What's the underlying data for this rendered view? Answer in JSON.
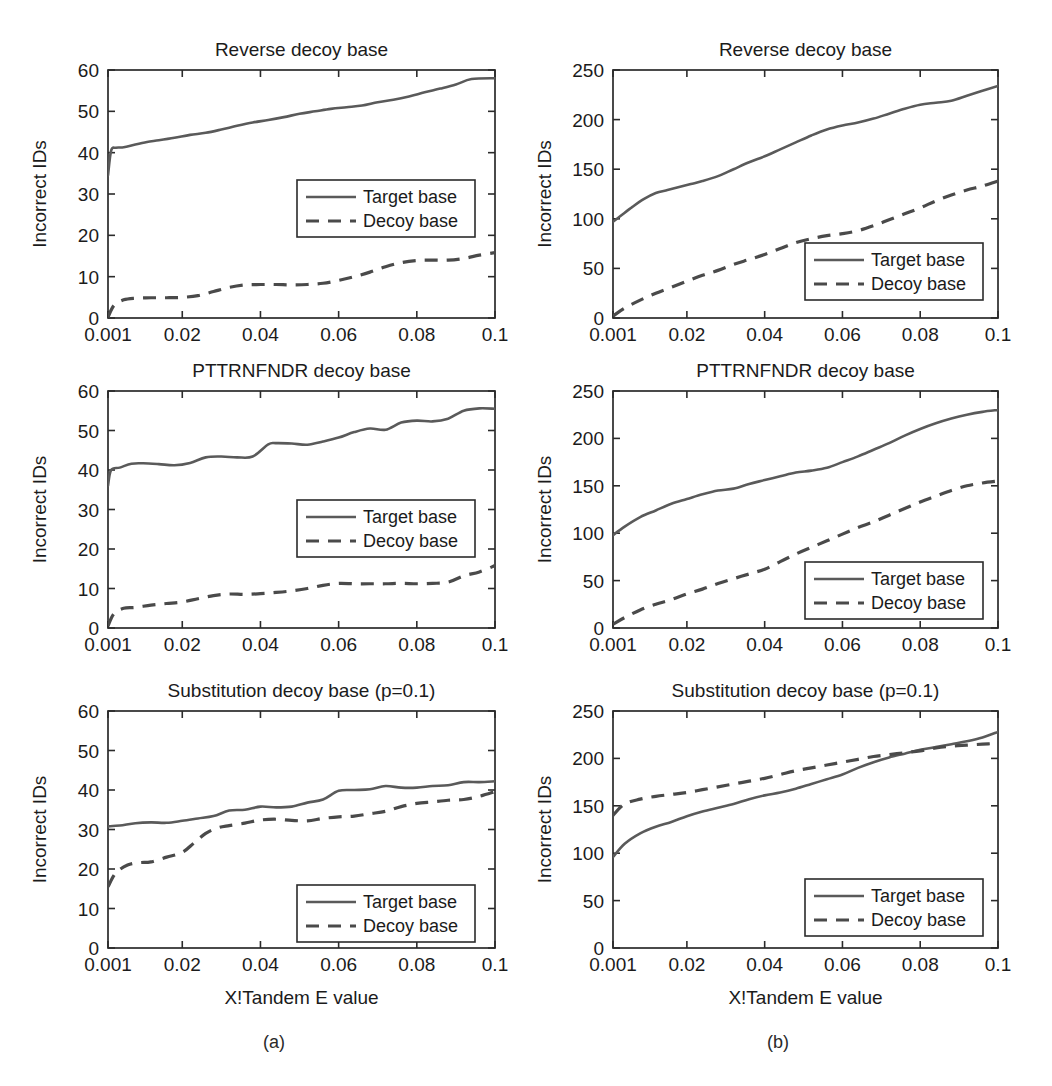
{
  "figure": {
    "subcaptions": [
      {
        "label": "(a)",
        "x": 274,
        "y": 1048
      },
      {
        "label": "(b)",
        "x": 778,
        "y": 1048
      }
    ],
    "colors": {
      "target_line": "#5a5a5a",
      "decoy_line": "#4a4a4a",
      "axis": "#2b2b2b",
      "text": "#1b1b1b",
      "background": "#ffffff"
    }
  },
  "chart_data": [
    {
      "id": "a-top",
      "type": "line",
      "title": "Reverse decoy base",
      "xlabel": "",
      "ylabel": "Incorrect IDs",
      "xticklabels": [
        "0.001",
        "0.02",
        "0.04",
        "0.06",
        "0.08",
        "0.1"
      ],
      "xtickvalues": [
        0.001,
        0.02,
        0.04,
        0.06,
        0.08,
        0.1
      ],
      "yticklabels": [
        "0",
        "10",
        "20",
        "30",
        "40",
        "50",
        "60"
      ],
      "ytickvalues": [
        0,
        10,
        20,
        30,
        40,
        50,
        60
      ],
      "xlim": [
        0.001,
        0.1
      ],
      "ylim": [
        0,
        60
      ],
      "grid": false,
      "legend_position": "center",
      "legend": [
        "Target base",
        "Decoy base"
      ],
      "series": [
        {
          "name": "Target base",
          "style": "solid",
          "x": [
            0.001,
            0.0018,
            0.003,
            0.005,
            0.008,
            0.011,
            0.014,
            0.018,
            0.022,
            0.026,
            0.03,
            0.034,
            0.038,
            0.042,
            0.046,
            0.05,
            0.054,
            0.058,
            0.062,
            0.066,
            0.07,
            0.074,
            0.078,
            0.082,
            0.086,
            0.09,
            0.094,
            0.1
          ],
          "values": [
            34.5,
            40.5,
            41.2,
            41.3,
            42.0,
            42.6,
            43.0,
            43.6,
            44.3,
            44.8,
            45.6,
            46.5,
            47.3,
            47.9,
            48.6,
            49.4,
            50.0,
            50.6,
            51.0,
            51.4,
            52.2,
            52.8,
            53.6,
            54.6,
            55.5,
            56.5,
            57.8,
            58.0
          ]
        },
        {
          "name": "Decoy base",
          "style": "dashed",
          "x": [
            0.001,
            0.0025,
            0.005,
            0.008,
            0.012,
            0.016,
            0.02,
            0.024,
            0.028,
            0.032,
            0.036,
            0.04,
            0.044,
            0.048,
            0.052,
            0.056,
            0.06,
            0.064,
            0.068,
            0.072,
            0.076,
            0.08,
            0.084,
            0.088,
            0.092,
            0.096,
            0.1
          ],
          "values": [
            0.2,
            3.0,
            4.4,
            4.8,
            4.9,
            4.9,
            5.0,
            5.4,
            6.4,
            7.4,
            8.0,
            8.1,
            8.1,
            8.0,
            8.1,
            8.4,
            9.1,
            10.0,
            11.1,
            12.4,
            13.4,
            13.9,
            14.0,
            14.0,
            14.4,
            15.2,
            15.8
          ]
        }
      ]
    },
    {
      "id": "b-top",
      "type": "line",
      "title": "Reverse decoy base",
      "xlabel": "",
      "ylabel": "Incorrect IDs",
      "xticklabels": [
        "0.001",
        "0.02",
        "0.04",
        "0.06",
        "0.08",
        "0.1"
      ],
      "xtickvalues": [
        0.001,
        0.02,
        0.04,
        0.06,
        0.08,
        0.1
      ],
      "yticklabels": [
        "0",
        "50",
        "100",
        "150",
        "200",
        "250"
      ],
      "ytickvalues": [
        0,
        50,
        100,
        150,
        200,
        250
      ],
      "xlim": [
        0.001,
        0.1
      ],
      "ylim": [
        0,
        250
      ],
      "grid": false,
      "legend_position": "lower-right",
      "legend": [
        "Target base",
        "Decoy base"
      ],
      "series": [
        {
          "name": "Target base",
          "style": "solid",
          "x": [
            0.001,
            0.003,
            0.006,
            0.009,
            0.012,
            0.015,
            0.018,
            0.021,
            0.024,
            0.028,
            0.032,
            0.036,
            0.04,
            0.044,
            0.048,
            0.052,
            0.056,
            0.06,
            0.064,
            0.068,
            0.072,
            0.076,
            0.08,
            0.084,
            0.088,
            0.092,
            0.096,
            0.1
          ],
          "values": [
            97,
            103,
            112,
            120,
            126,
            129,
            132,
            135,
            138,
            143,
            150,
            157,
            163,
            170,
            177,
            184,
            190,
            194,
            197,
            201,
            206,
            211,
            215,
            217,
            219,
            224,
            229,
            234
          ]
        },
        {
          "name": "Decoy base",
          "style": "dashed",
          "x": [
            0.001,
            0.004,
            0.008,
            0.012,
            0.016,
            0.02,
            0.024,
            0.028,
            0.032,
            0.036,
            0.04,
            0.044,
            0.048,
            0.052,
            0.056,
            0.06,
            0.064,
            0.068,
            0.072,
            0.076,
            0.08,
            0.084,
            0.088,
            0.092,
            0.096,
            0.1
          ],
          "values": [
            2,
            10,
            18,
            25,
            31,
            37,
            43,
            48,
            54,
            59,
            64,
            70,
            76,
            80,
            83,
            85,
            88,
            93,
            99,
            105,
            111,
            118,
            124,
            129,
            133,
            138
          ]
        }
      ]
    },
    {
      "id": "a-mid",
      "type": "line",
      "title": "PTTRNFNDR decoy base",
      "xlabel": "",
      "ylabel": "Incorrect IDs",
      "xticklabels": [
        "0.001",
        "0.02",
        "0.04",
        "0.06",
        "0.08",
        "0.1"
      ],
      "xtickvalues": [
        0.001,
        0.02,
        0.04,
        0.06,
        0.08,
        0.1
      ],
      "yticklabels": [
        "0",
        "10",
        "20",
        "30",
        "40",
        "50",
        "60"
      ],
      "ytickvalues": [
        0,
        10,
        20,
        30,
        40,
        50,
        60
      ],
      "xlim": [
        0.001,
        0.1
      ],
      "ylim": [
        0,
        60
      ],
      "grid": false,
      "legend_position": "center",
      "legend": [
        "Target base",
        "Decoy base"
      ],
      "series": [
        {
          "name": "Target base",
          "style": "solid",
          "x": [
            0.001,
            0.0018,
            0.004,
            0.007,
            0.01,
            0.014,
            0.018,
            0.022,
            0.026,
            0.03,
            0.034,
            0.038,
            0.042,
            0.044,
            0.048,
            0.052,
            0.056,
            0.06,
            0.064,
            0.068,
            0.072,
            0.076,
            0.08,
            0.084,
            0.088,
            0.092,
            0.096,
            0.1
          ],
          "values": [
            36.0,
            40.0,
            40.6,
            41.6,
            41.7,
            41.5,
            41.2,
            41.8,
            43.2,
            43.4,
            43.2,
            43.4,
            46.5,
            46.8,
            46.7,
            46.4,
            47.2,
            48.2,
            49.6,
            50.5,
            50.2,
            52.0,
            52.5,
            52.3,
            53.0,
            55.0,
            55.6,
            55.5
          ]
        },
        {
          "name": "Decoy base",
          "style": "dashed",
          "x": [
            0.001,
            0.0025,
            0.005,
            0.008,
            0.012,
            0.016,
            0.02,
            0.024,
            0.028,
            0.032,
            0.036,
            0.04,
            0.044,
            0.048,
            0.052,
            0.056,
            0.06,
            0.064,
            0.068,
            0.072,
            0.076,
            0.08,
            0.084,
            0.088,
            0.092,
            0.096,
            0.1
          ],
          "values": [
            0.5,
            3.6,
            5.0,
            5.2,
            5.8,
            6.2,
            6.6,
            7.4,
            8.2,
            8.6,
            8.5,
            8.7,
            9.0,
            9.4,
            10.0,
            10.8,
            11.3,
            11.2,
            11.2,
            11.2,
            11.3,
            11.2,
            11.3,
            11.6,
            13.2,
            14.2,
            15.8
          ]
        }
      ]
    },
    {
      "id": "b-mid",
      "type": "line",
      "title": "PTTRNFNDR decoy base",
      "xlabel": "",
      "ylabel": "Incorrect IDs",
      "xticklabels": [
        "0.001",
        "0.02",
        "0.04",
        "0.06",
        "0.08",
        "0.1"
      ],
      "xtickvalues": [
        0.001,
        0.02,
        0.04,
        0.06,
        0.08,
        0.1
      ],
      "yticklabels": [
        "0",
        "50",
        "100",
        "150",
        "200",
        "250"
      ],
      "ytickvalues": [
        0,
        50,
        100,
        150,
        200,
        250
      ],
      "xlim": [
        0.001,
        0.1
      ],
      "ylim": [
        0,
        250
      ],
      "grid": false,
      "legend_position": "lower-right",
      "legend": [
        "Target base",
        "Decoy base"
      ],
      "series": [
        {
          "name": "Target base",
          "style": "solid",
          "x": [
            0.001,
            0.004,
            0.008,
            0.012,
            0.016,
            0.02,
            0.024,
            0.028,
            0.032,
            0.036,
            0.04,
            0.044,
            0.048,
            0.052,
            0.056,
            0.06,
            0.064,
            0.068,
            0.072,
            0.076,
            0.08,
            0.084,
            0.088,
            0.092,
            0.096,
            0.1
          ],
          "values": [
            98,
            107,
            117,
            124,
            131,
            136,
            141,
            145,
            147,
            152,
            156,
            160,
            164,
            166,
            169,
            175,
            181,
            188,
            195,
            203,
            210,
            216,
            221,
            225,
            228,
            230
          ]
        },
        {
          "name": "Decoy base",
          "style": "dashed",
          "x": [
            0.001,
            0.004,
            0.008,
            0.012,
            0.016,
            0.02,
            0.024,
            0.028,
            0.032,
            0.036,
            0.04,
            0.044,
            0.048,
            0.052,
            0.056,
            0.06,
            0.064,
            0.068,
            0.072,
            0.076,
            0.08,
            0.084,
            0.088,
            0.092,
            0.096,
            0.1
          ],
          "values": [
            4,
            11,
            19,
            25,
            30,
            36,
            41,
            47,
            52,
            57,
            62,
            70,
            78,
            85,
            92,
            99,
            106,
            112,
            119,
            126,
            133,
            139,
            145,
            150,
            153,
            155
          ]
        }
      ]
    },
    {
      "id": "a-bot",
      "type": "line",
      "title": "Substitution decoy base (p=0.1)",
      "xlabel": "X!Tandem E value",
      "ylabel": "Incorrect IDs",
      "xticklabels": [
        "0.001",
        "0.02",
        "0.04",
        "0.06",
        "0.08",
        "0.1"
      ],
      "xtickvalues": [
        0.001,
        0.02,
        0.04,
        0.06,
        0.08,
        0.1
      ],
      "yticklabels": [
        "0",
        "10",
        "20",
        "30",
        "40",
        "50",
        "60"
      ],
      "ytickvalues": [
        0,
        10,
        20,
        30,
        40,
        50,
        60
      ],
      "xlim": [
        0.001,
        0.1
      ],
      "ylim": [
        0,
        60
      ],
      "grid": false,
      "legend_position": "lower-right",
      "legend": [
        "Target base",
        "Decoy base"
      ],
      "series": [
        {
          "name": "Target base",
          "style": "solid",
          "x": [
            0.001,
            0.004,
            0.008,
            0.012,
            0.016,
            0.02,
            0.024,
            0.028,
            0.032,
            0.036,
            0.04,
            0.044,
            0.048,
            0.052,
            0.056,
            0.06,
            0.064,
            0.068,
            0.072,
            0.076,
            0.08,
            0.084,
            0.088,
            0.092,
            0.096,
            0.1
          ],
          "values": [
            30.8,
            31.0,
            31.6,
            31.8,
            31.7,
            32.2,
            32.8,
            33.4,
            34.8,
            35.0,
            35.8,
            35.6,
            35.8,
            36.8,
            37.6,
            39.8,
            40.0,
            40.2,
            41.0,
            40.6,
            40.6,
            41.0,
            41.2,
            42.0,
            42.0,
            42.2
          ]
        },
        {
          "name": "Decoy base",
          "style": "dashed",
          "x": [
            0.001,
            0.003,
            0.006,
            0.009,
            0.012,
            0.016,
            0.02,
            0.023,
            0.026,
            0.029,
            0.032,
            0.036,
            0.04,
            0.044,
            0.048,
            0.052,
            0.056,
            0.06,
            0.064,
            0.068,
            0.072,
            0.076,
            0.08,
            0.084,
            0.088,
            0.092,
            0.096,
            0.1
          ],
          "values": [
            15.5,
            19.0,
            21.0,
            21.6,
            21.8,
            23.0,
            24.2,
            26.6,
            29.0,
            30.4,
            31.0,
            31.6,
            32.4,
            32.6,
            32.3,
            32.2,
            32.8,
            33.2,
            33.4,
            34.0,
            34.6,
            35.8,
            36.6,
            37.0,
            37.4,
            37.6,
            38.4,
            39.6
          ]
        }
      ]
    },
    {
      "id": "b-bot",
      "type": "line",
      "title": "Substitution decoy base (p=0.1)",
      "xlabel": "X!Tandem E value",
      "ylabel": "Incorrect IDs",
      "xticklabels": [
        "0.001",
        "0.02",
        "0.04",
        "0.06",
        "0.08",
        "0.1"
      ],
      "xtickvalues": [
        0.001,
        0.02,
        0.04,
        0.06,
        0.08,
        0.1
      ],
      "yticklabels": [
        "0",
        "50",
        "100",
        "150",
        "200",
        "250"
      ],
      "ytickvalues": [
        0,
        50,
        100,
        150,
        200,
        250
      ],
      "xlim": [
        0.001,
        0.1
      ],
      "ylim": [
        0,
        250
      ],
      "grid": false,
      "legend_position": "lower-right",
      "legend": [
        "Target base",
        "Decoy base"
      ],
      "series": [
        {
          "name": "Target base",
          "style": "solid",
          "x": [
            0.001,
            0.004,
            0.008,
            0.012,
            0.016,
            0.02,
            0.024,
            0.028,
            0.032,
            0.036,
            0.04,
            0.044,
            0.048,
            0.052,
            0.056,
            0.06,
            0.064,
            0.068,
            0.072,
            0.076,
            0.08,
            0.084,
            0.088,
            0.092,
            0.096,
            0.1
          ],
          "values": [
            96,
            110,
            121,
            128,
            133,
            139,
            144,
            148,
            152,
            157,
            161,
            164,
            168,
            173,
            178,
            183,
            190,
            196,
            201,
            205,
            209,
            212,
            215,
            218,
            222,
            228
          ]
        },
        {
          "name": "Decoy base",
          "style": "dashed",
          "x": [
            0.001,
            0.004,
            0.008,
            0.012,
            0.016,
            0.02,
            0.024,
            0.028,
            0.032,
            0.036,
            0.04,
            0.044,
            0.048,
            0.052,
            0.056,
            0.06,
            0.064,
            0.068,
            0.072,
            0.076,
            0.08,
            0.084,
            0.088,
            0.092,
            0.096,
            0.1
          ],
          "values": [
            140,
            152,
            157,
            160,
            162,
            164,
            167,
            170,
            173,
            176,
            179,
            183,
            187,
            190,
            193,
            196,
            199,
            202,
            204,
            206,
            208,
            211,
            213,
            214,
            215,
            216
          ]
        }
      ]
    }
  ]
}
